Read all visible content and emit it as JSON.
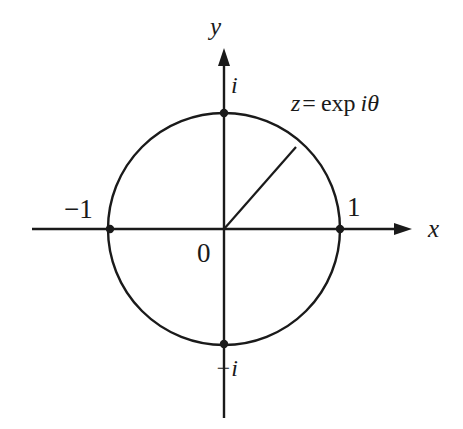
{
  "figure": {
    "background_color": "#ffffff",
    "stroke_color": "#1a1a1a",
    "width": 463,
    "height": 429
  },
  "axes": {
    "x_axis": {
      "label": "x",
      "start_x": 32,
      "end_x": 412,
      "y": 229,
      "arrow": "right-arrowhead"
    },
    "y_axis": {
      "label": "y",
      "start_y": 418,
      "end_y": 48,
      "x": 224,
      "arrow": "up-arrowhead"
    }
  },
  "circle": {
    "center_x": 224,
    "center_y": 229,
    "radius": 116,
    "label": "unit-circle"
  },
  "points": [
    {
      "name": "point-one-positive",
      "label": "1",
      "cx": 340,
      "cy": 229,
      "label_x": 347,
      "label_y": 194
    },
    {
      "name": "point-one-negative",
      "label": "−1",
      "cx": 110,
      "cy": 229,
      "label_x": 64,
      "label_y": 196
    },
    {
      "name": "point-i-positive",
      "label": "i",
      "cx": 224,
      "cy": 113,
      "label_x": 231,
      "label_y": 73
    },
    {
      "name": "point-i-negative",
      "label": "−i",
      "cx": 224,
      "cy": 344,
      "label_x": 215,
      "label_y": 356
    }
  ],
  "origin": {
    "label": "0",
    "x": 224,
    "y": 229,
    "label_x": 197,
    "label_y": 240
  },
  "radius_vector": {
    "name": "radius-to-z",
    "from_x": 224,
    "from_y": 229,
    "to_x": 296,
    "to_y": 147,
    "angle_degrees": 48.7
  },
  "annotation": {
    "z_symbol": "z",
    "equals": "=",
    "exp_word": "exp",
    "i_symbol": "i",
    "theta_symbol": "θ",
    "full_text": "z = exp iθ"
  }
}
